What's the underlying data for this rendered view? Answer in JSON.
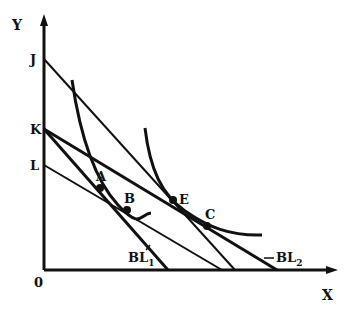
{
  "diagram": {
    "axes": {
      "x_label": "X",
      "y_label": "Y",
      "origin_label": "0",
      "origin": [
        44,
        270
      ],
      "x_end": 336,
      "y_top": 16
    },
    "y_intercepts": [
      {
        "id": "J",
        "label": "J",
        "y": 59
      },
      {
        "id": "K",
        "label": "K",
        "y": 129
      },
      {
        "id": "L",
        "label": "L",
        "y": 165
      }
    ],
    "budget_lines": [
      {
        "id": "BL1",
        "from": "K",
        "x_intercept": 168,
        "label": "BL",
        "sub": "1"
      },
      {
        "id": "L-line",
        "from": "L",
        "x_intercept": 222
      },
      {
        "id": "J-line",
        "from": "J",
        "x_intercept": 235
      },
      {
        "id": "BL2",
        "from": "K",
        "x_intercept": 277,
        "label": "BL",
        "sub": "2"
      }
    ],
    "indifference_curves": [
      {
        "id": "IC1",
        "path": "M 72 80 C 80 135, 95 180, 118 205 S 140 214, 151 213"
      },
      {
        "id": "IC2",
        "path": "M 145 128 C 150 170, 162 195, 185 211 S 230 236, 262 235"
      }
    ],
    "points": [
      {
        "id": "A",
        "label": "A",
        "x": 100,
        "y": 188,
        "lx": 96,
        "ly": 181
      },
      {
        "id": "B",
        "label": "B",
        "x": 127,
        "y": 210,
        "lx": 124,
        "ly": 203
      },
      {
        "id": "E",
        "label": "E",
        "x": 173,
        "y": 200,
        "lx": 179,
        "ly": 204
      },
      {
        "id": "C",
        "label": "C",
        "x": 207,
        "y": 226,
        "lx": 205,
        "ly": 219
      }
    ],
    "line_labels": [
      {
        "id": "BL1-label",
        "text": "BL",
        "sub": "1",
        "x": 128,
        "y": 262
      },
      {
        "id": "BL2-label",
        "text": "BL",
        "sub": "2",
        "x": 276,
        "y": 262
      }
    ],
    "colors": {
      "ink": "#111111",
      "background": "#ffffff"
    }
  }
}
